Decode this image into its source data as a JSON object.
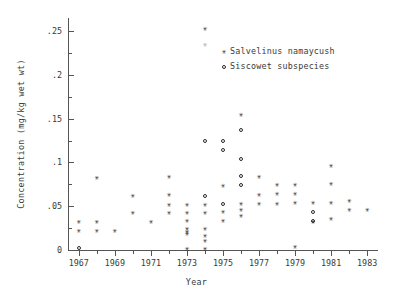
{
  "chart_data": {
    "type": "scatter",
    "title": "",
    "xlabel": "Year",
    "ylabel": "Concentration (mg/kg wet wt)",
    "xlim": [
      1966.4,
      1983.6
    ],
    "ylim": [
      0,
      0.265
    ],
    "grid": false,
    "legend_position": "top-right",
    "x_ticks_major": [
      1967,
      1969,
      1971,
      1973,
      1975,
      1977,
      1979,
      1981,
      1983
    ],
    "x_tick_labels": [
      "1967",
      "1969",
      "1971",
      "1973",
      "1975",
      "1977",
      "1979",
      "1981",
      "1983"
    ],
    "x_ticks_minor": [
      1968,
      1970,
      1972,
      1974,
      1976,
      1978,
      1980,
      1982
    ],
    "y_ticks_major": [
      0,
      0.05,
      0.1,
      0.15,
      0.2,
      0.25
    ],
    "y_tick_labels": [
      "0",
      ".05",
      ".1",
      ".15",
      ".2",
      ".25"
    ],
    "y_ticks_minor": [
      0.025,
      0.075,
      0.125,
      0.175,
      0.225
    ],
    "series": [
      {
        "name": "Salvelinus namaycush",
        "marker": "star",
        "points": [
          [
            1967,
            0.032
          ],
          [
            1967,
            0.022
          ],
          [
            1968,
            0.083
          ],
          [
            1968,
            0.032
          ],
          [
            1968,
            0.022
          ],
          [
            1969,
            0.022
          ],
          [
            1970,
            0.062
          ],
          [
            1970,
            0.043
          ],
          [
            1971,
            0.033
          ],
          [
            1972,
            0.084
          ],
          [
            1972,
            0.063
          ],
          [
            1972,
            0.052
          ],
          [
            1972,
            0.043
          ],
          [
            1973,
            0.052
          ],
          [
            1973,
            0.043
          ],
          [
            1973,
            0.034
          ],
          [
            1973,
            0.025
          ],
          [
            1973,
            0.021
          ],
          [
            1973,
            0.019
          ],
          [
            1973,
            0.002
          ],
          [
            1974,
            0.253
          ],
          [
            1974,
            0.235
          ],
          [
            1974,
            0.052
          ],
          [
            1974,
            0.043
          ],
          [
            1974,
            0.024
          ],
          [
            1974,
            0.016
          ],
          [
            1974,
            0.011
          ],
          [
            1974,
            0.002
          ],
          [
            1975,
            0.074
          ],
          [
            1975,
            0.044
          ],
          [
            1975,
            0.034
          ],
          [
            1976,
            0.155
          ],
          [
            1976,
            0.053
          ],
          [
            1976,
            0.046
          ],
          [
            1976,
            0.039
          ],
          [
            1977,
            0.084
          ],
          [
            1977,
            0.063
          ],
          [
            1977,
            0.053
          ],
          [
            1978,
            0.064
          ],
          [
            1978,
            0.075
          ],
          [
            1978,
            0.053
          ],
          [
            1979,
            0.075
          ],
          [
            1979,
            0.064
          ],
          [
            1979,
            0.054
          ],
          [
            1979,
            0.004
          ],
          [
            1980,
            0.054
          ],
          [
            1980,
            0.033
          ],
          [
            1981,
            0.097
          ],
          [
            1981,
            0.076
          ],
          [
            1981,
            0.054
          ],
          [
            1981,
            0.036
          ],
          [
            1982,
            0.056
          ],
          [
            1982,
            0.046
          ],
          [
            1983,
            0.046
          ]
        ]
      },
      {
        "name": "Siscowet subspecies",
        "marker": "circle",
        "points": [
          [
            1967,
            0.002
          ],
          [
            1974,
            0.125
          ],
          [
            1974,
            0.062
          ],
          [
            1975,
            0.124
          ],
          [
            1975,
            0.114
          ],
          [
            1975,
            0.053
          ],
          [
            1976,
            0.137
          ],
          [
            1976,
            0.104
          ],
          [
            1976,
            0.084
          ],
          [
            1976,
            0.074
          ],
          [
            1980,
            0.043
          ],
          [
            1980,
            0.033
          ]
        ]
      }
    ]
  },
  "legend": {
    "entries": [
      {
        "symbol": "star-marker",
        "label": "Salvelinus namaycush"
      },
      {
        "symbol": "circle-marker",
        "label": "Siscowet subspecies"
      }
    ]
  }
}
